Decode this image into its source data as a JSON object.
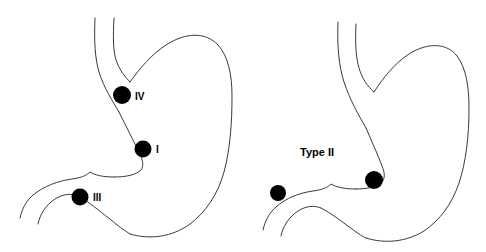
{
  "figure": {
    "background_color": "#ffffff",
    "stroke_color": "#3a3a3a",
    "marker_color": "#000000",
    "width": 486,
    "height": 252
  },
  "panels": [
    {
      "id": "left-stomach",
      "caption": "",
      "organ": "stomach",
      "markers": [
        {
          "id": "marker-iv",
          "label": "IV",
          "cx": 122,
          "cy": 95,
          "r": 9.0,
          "label_x": 135,
          "label_y": 97,
          "site": "high lesser curvature"
        },
        {
          "id": "marker-i",
          "label": "I",
          "cx": 143,
          "cy": 149,
          "r": 8.5,
          "label_x": 156,
          "label_y": 150,
          "site": "mid lesser curvature"
        },
        {
          "id": "marker-iii",
          "label": "III",
          "cx": 80,
          "cy": 197,
          "r": 8.5,
          "label_x": 93,
          "label_y": 198,
          "site": "prepyloric"
        }
      ]
    },
    {
      "id": "right-stomach",
      "caption": "Type II",
      "caption_x": 300,
      "caption_y": 153,
      "organ": "stomach",
      "markers": [
        {
          "id": "marker-ii-gastric",
          "label": "",
          "cx": 374,
          "cy": 180,
          "r": 9.0,
          "label_x": 0,
          "label_y": 0,
          "site": "lesser curvature"
        },
        {
          "id": "marker-ii-duodenal",
          "label": "",
          "cx": 278,
          "cy": 193,
          "r": 8.0,
          "label_x": 0,
          "label_y": 0,
          "site": "duodenal bulb"
        }
      ]
    }
  ],
  "labels": {
    "type_iv": "IV",
    "type_i": "I",
    "type_iii": "III",
    "type_ii": "Type II"
  }
}
